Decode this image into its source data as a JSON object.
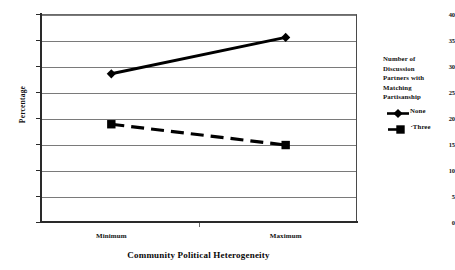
{
  "chart_data": {
    "type": "line",
    "title": "",
    "xlabel": "Community Political Heterogeneity",
    "ylabel": "Percentage",
    "categories": [
      "Minimum",
      "Maximum"
    ],
    "series": [
      {
        "name": "None",
        "values": [
          28.5,
          35.5
        ],
        "marker": "diamond",
        "line_style": "solid",
        "color": "#000000"
      },
      {
        "name": "Three",
        "values": [
          18.8,
          14.8
        ],
        "marker": "square",
        "line_style": "dashed",
        "color": "#000000"
      }
    ],
    "ylim": [
      0,
      40
    ],
    "ytick_step": 5,
    "yticks": [
      "40",
      "35",
      "30",
      "25",
      "20",
      "15",
      "10",
      "5",
      "0"
    ],
    "grid": true,
    "legend_position": "right",
    "legend_title": "Number of Discussion Partners with Matching Partisanship"
  },
  "axes": {
    "y_title": "Percentage",
    "x_title": "Community Political Heterogeneity"
  },
  "legend": {
    "title_lines": [
      "Number of",
      "Discussion",
      "Partners with",
      "Matching",
      "Partisanship"
    ],
    "entries": [
      {
        "label": "None",
        "prefix": ""
      },
      {
        "label": "Three",
        "prefix": "·"
      }
    ]
  }
}
